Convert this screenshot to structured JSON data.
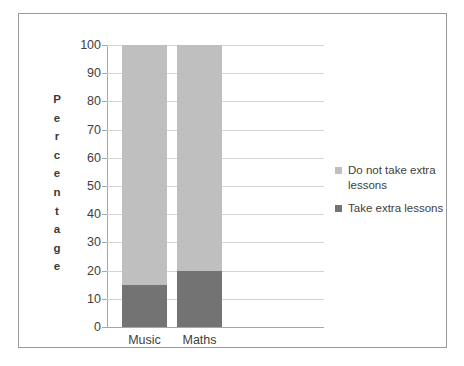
{
  "chart_data": {
    "type": "bar",
    "subtype": "stacked-bar-100",
    "title": "",
    "xlabel": "",
    "ylabel": "Percentage",
    "ylim": [
      0,
      100
    ],
    "ytick_step": 10,
    "yticks": [
      "100",
      "90",
      "80",
      "70",
      "60",
      "50",
      "40",
      "30",
      "20",
      "10",
      "0"
    ],
    "categories": [
      "Music",
      "Maths"
    ],
    "grid": true,
    "legend_position": "right",
    "series": [
      {
        "name": "Do not take extra lessons",
        "color": "#bfbfbf",
        "values": [
          85,
          80
        ]
      },
      {
        "name": "Take extra lessons",
        "color": "#737373",
        "values": [
          15,
          20
        ]
      }
    ],
    "stack_order_bottom_to_top": [
      "Take extra lessons",
      "Do not take extra lessons"
    ]
  },
  "axis": {
    "y_title_letters": [
      "P",
      "e",
      "r",
      "c",
      "e",
      "n",
      "t",
      "a",
      "g",
      "e"
    ]
  },
  "legend": {
    "items": [
      {
        "label": "Do not take extra lessons",
        "color": "#bfbfbf"
      },
      {
        "label": "Take extra lessons",
        "color": "#737373"
      }
    ]
  },
  "colors": {
    "frame_border": "#9a9a9a",
    "gridline": "#d4d4d4",
    "axis_line": "#a6a6a6",
    "text": "#404040",
    "background": "#ffffff"
  }
}
